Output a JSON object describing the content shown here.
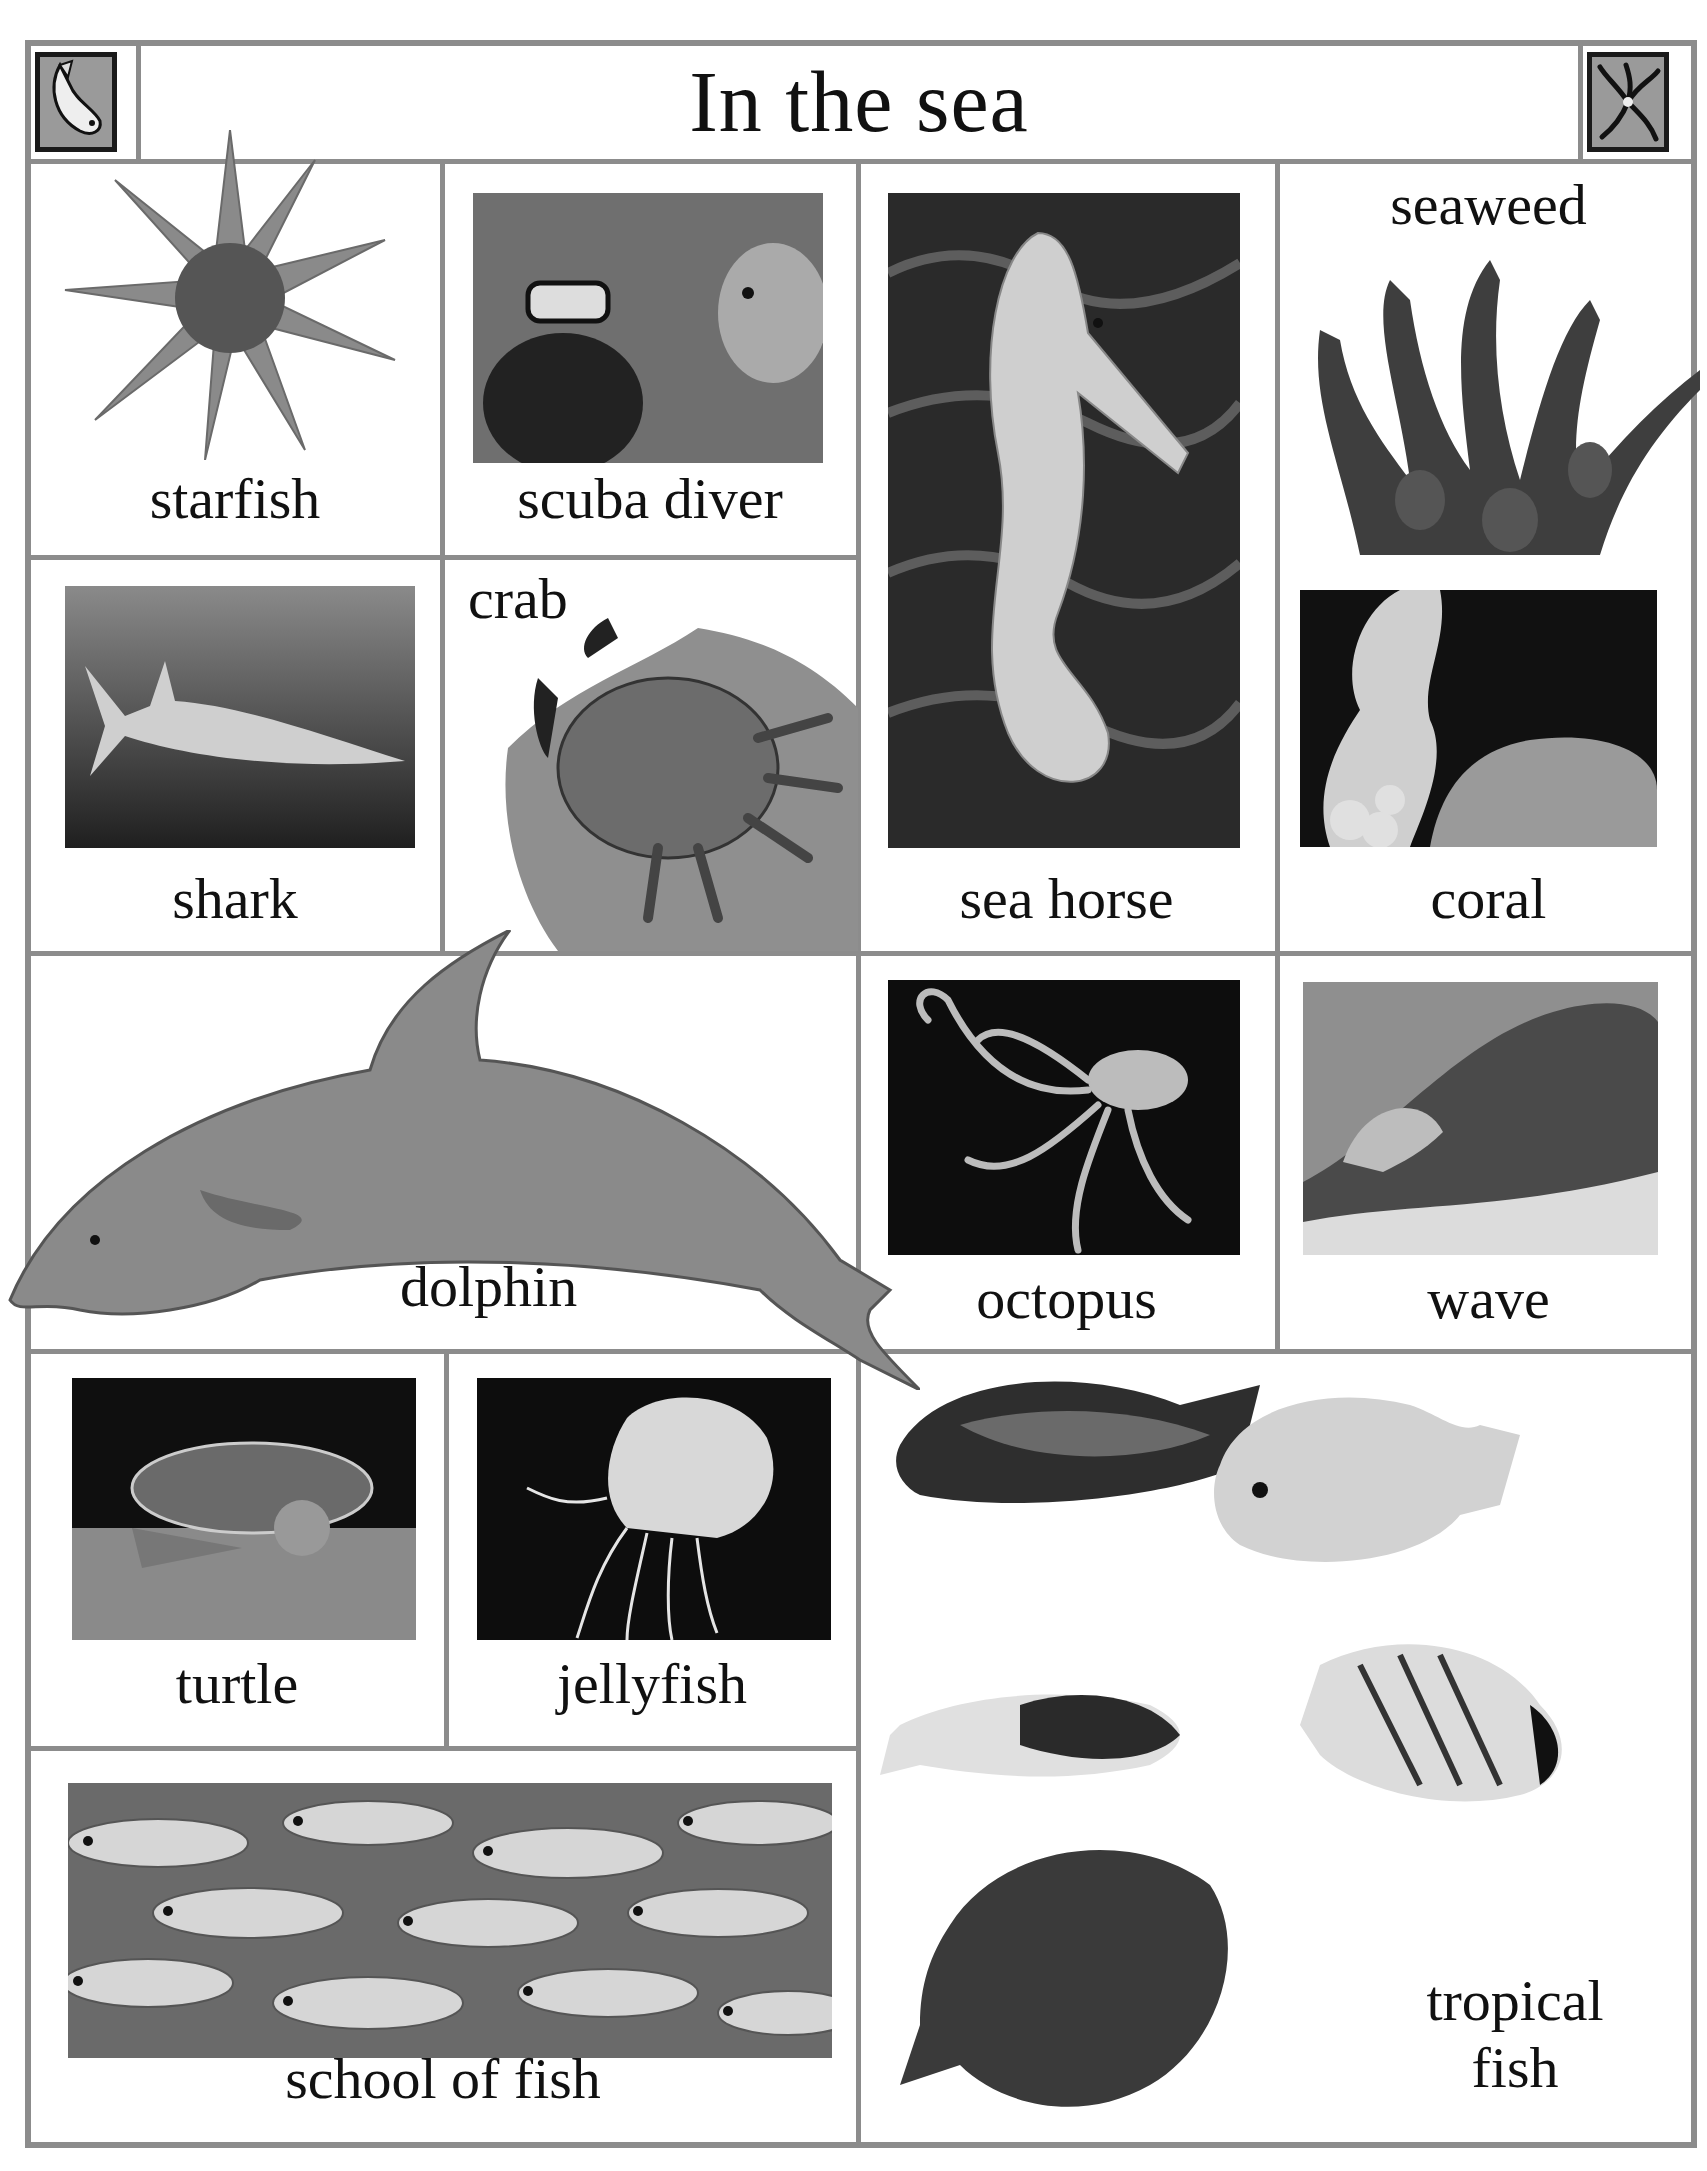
{
  "header": {
    "title": "In the sea",
    "left_icon": "fish-icon",
    "right_icon": "brittle-star-icon"
  },
  "cells": {
    "starfish": {
      "label": "starfish",
      "icon": "starfish-image"
    },
    "scuba_diver": {
      "label": "scuba diver",
      "icon": "scuba-diver-photo"
    },
    "sea_horse": {
      "label": "sea horse",
      "icon": "sea-horse-photo"
    },
    "seaweed": {
      "label": "seaweed",
      "icon": "seaweed-image"
    },
    "shark": {
      "label": "shark",
      "icon": "shark-photo"
    },
    "crab": {
      "label": "crab",
      "icon": "crab-image"
    },
    "coral": {
      "label": "coral",
      "icon": "coral-photo"
    },
    "dolphin": {
      "label": "dolphin",
      "icon": "dolphin-image"
    },
    "octopus": {
      "label": "octopus",
      "icon": "octopus-photo"
    },
    "wave": {
      "label": "wave",
      "icon": "wave-photo"
    },
    "turtle": {
      "label": "turtle",
      "icon": "turtle-photo"
    },
    "jellyfish": {
      "label": "jellyfish",
      "icon": "jellyfish-photo"
    },
    "school_of_fish": {
      "label": "school of fish",
      "icon": "school-of-fish-photo"
    },
    "tropical_fish": {
      "label_line1": "tropical",
      "label_line2": "fish",
      "icon": "tropical-fish-images"
    }
  },
  "colors": {
    "border": "#8c8c8c",
    "text": "#111111",
    "background": "#ffffff"
  }
}
